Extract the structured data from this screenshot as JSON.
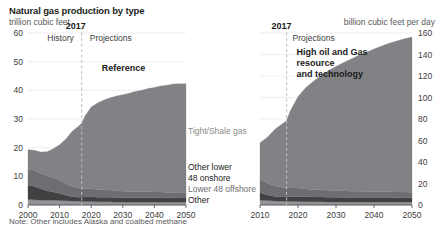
{
  "header": {
    "title": "Natural gas production by type",
    "subtitle_left": "trillion cubic feet",
    "subtitle_right": "billion cubic feet per day"
  },
  "footer": {
    "note": "Note: Other includes Alaska and coalbed methane"
  },
  "legend": {
    "tight_shale": "Tight/Shale gas",
    "other_lower_48_onshore_line1": "Other lower",
    "other_lower_48_onshore_line2": "48 onshore",
    "lower_48_offshore": "Lower 48 offshore",
    "other": "Other"
  },
  "colors": {
    "tight_shale": "#808285",
    "other_lower_48_onshore": "#6d6e71",
    "lower_48_offshore": "#414042",
    "other": "#939598",
    "axis": "#58595b",
    "gridline": "#e6e7e8",
    "divider": "#bcbec0"
  },
  "left_chart": {
    "divider_year_label": "2017",
    "history_label": "History",
    "projections_label": "Projections",
    "case_label": "Reference",
    "x_ticks": [
      "2000",
      "2010",
      "2020",
      "2030",
      "2040",
      "2050"
    ],
    "y_ticks": [
      "0",
      "10",
      "20",
      "30",
      "40",
      "50",
      "60"
    ]
  },
  "right_chart": {
    "divider_year_label": "2017",
    "projections_label": "Projections",
    "case_label_line1": "High oil and Gas",
    "case_label_line2": "resource",
    "case_label_line3": "and technology",
    "x_ticks": [
      "2010",
      "2020",
      "2030",
      "2040",
      "2050"
    ],
    "y_ticks": [
      "0",
      "20",
      "40",
      "60",
      "80",
      "100",
      "120",
      "140",
      "160"
    ]
  },
  "chart_data": [
    {
      "type": "area",
      "id": "reference-case",
      "title": "Natural gas production by type — Reference",
      "subtitle": "trillion cubic feet",
      "xlabel": "",
      "ylabel": "trillion cubic feet",
      "xlim": [
        2000,
        2050
      ],
      "ylim": [
        0,
        60
      ],
      "ytick_step": 10,
      "xtick_step": 10,
      "grid": true,
      "stacked": true,
      "legend_position": "right-inline",
      "history_projection_split": 2017,
      "x": [
        2000,
        2002,
        2004,
        2006,
        2008,
        2010,
        2012,
        2014,
        2016,
        2017,
        2018,
        2020,
        2022,
        2024,
        2026,
        2028,
        2030,
        2032,
        2034,
        2036,
        2038,
        2040,
        2042,
        2044,
        2046,
        2048,
        2050
      ],
      "series": [
        {
          "name": "Other",
          "color": "#939598",
          "values": [
            1.9,
            1.8,
            1.7,
            1.7,
            1.7,
            1.6,
            1.5,
            1.4,
            1.3,
            1.3,
            1.2,
            1.2,
            1.1,
            1.1,
            1.1,
            1.0,
            1.0,
            1.0,
            1.0,
            1.0,
            1.0,
            1.0,
            1.0,
            1.0,
            1.0,
            1.0,
            1.0
          ]
        },
        {
          "name": "Lower 48 offshore",
          "color": "#414042",
          "values": [
            5.0,
            4.7,
            4.0,
            3.3,
            2.8,
            2.5,
            1.9,
            1.5,
            1.4,
            1.5,
            1.6,
            1.7,
            1.6,
            1.6,
            1.6,
            1.6,
            1.5,
            1.5,
            1.5,
            1.5,
            1.5,
            1.5,
            1.5,
            1.5,
            1.5,
            1.4,
            1.4
          ]
        },
        {
          "name": "Other lower 48 onshore",
          "color": "#6d6e71",
          "values": [
            5.5,
            5.6,
            5.4,
            5.3,
            5.1,
            4.6,
            4.0,
            3.6,
            3.2,
            3.0,
            2.9,
            2.8,
            2.7,
            2.6,
            2.5,
            2.4,
            2.3,
            2.2,
            2.2,
            2.1,
            2.1,
            2.0,
            2.0,
            1.9,
            1.9,
            1.9,
            1.8
          ]
        },
        {
          "name": "Tight/Shale gas",
          "color": "#808285",
          "values": [
            6.9,
            7.0,
            7.4,
            8.3,
            10.0,
            12.3,
            15.6,
            19.2,
            21.6,
            22.7,
            25.3,
            28.5,
            30.2,
            31.3,
            32.2,
            33.0,
            33.7,
            34.3,
            34.9,
            35.4,
            36.0,
            36.5,
            37.0,
            37.4,
            37.8,
            38.0,
            38.1
          ]
        }
      ],
      "totals": [
        19.3,
        19.1,
        18.5,
        18.6,
        19.6,
        21.0,
        23.0,
        25.7,
        27.5,
        28.5,
        31.0,
        34.2,
        35.6,
        36.6,
        37.4,
        38.0,
        38.5,
        39.0,
        39.6,
        40.0,
        40.6,
        41.0,
        41.5,
        41.8,
        42.2,
        42.3,
        42.3
      ]
    },
    {
      "type": "area",
      "id": "high-oil-and-gas-resource-and-technology-case",
      "title": "Natural gas production by type — High oil and Gas resource and technology",
      "subtitle": "billion cubic feet per day",
      "xlabel": "",
      "ylabel": "billion cubic feet per day",
      "xlim": [
        2010,
        2050
      ],
      "ylim": [
        0,
        160
      ],
      "ytick_step": 20,
      "xtick_step": 10,
      "grid": true,
      "stacked": true,
      "legend_position": "shared-left",
      "history_projection_split": 2017,
      "x": [
        2010,
        2012,
        2014,
        2016,
        2017,
        2018,
        2020,
        2022,
        2024,
        2026,
        2028,
        2030,
        2032,
        2034,
        2036,
        2038,
        2040,
        2042,
        2044,
        2046,
        2048,
        2050
      ],
      "series": [
        {
          "name": "Other",
          "color": "#939598",
          "values": [
            4.4,
            4.1,
            3.8,
            3.6,
            3.6,
            3.4,
            3.3,
            3.1,
            3.0,
            3.0,
            2.9,
            2.9,
            2.8,
            2.8,
            2.8,
            2.8,
            2.8,
            2.8,
            2.8,
            2.8,
            2.8,
            2.8
          ]
        },
        {
          "name": "Lower 48 offshore",
          "color": "#414042",
          "values": [
            6.9,
            5.2,
            4.1,
            3.9,
            4.1,
            4.4,
            4.7,
            4.5,
            4.4,
            4.4,
            4.3,
            4.2,
            4.2,
            4.1,
            4.1,
            4.1,
            4.1,
            4.1,
            4.1,
            4.0,
            4.0,
            4.0
          ]
        },
        {
          "name": "Other lower 48 onshore",
          "color": "#6d6e71",
          "values": [
            12.6,
            11.0,
            9.9,
            8.8,
            8.3,
            8.0,
            7.7,
            7.4,
            7.1,
            6.9,
            6.6,
            6.4,
            6.2,
            6.0,
            5.9,
            5.7,
            5.6,
            5.5,
            5.4,
            5.3,
            5.2,
            5.1
          ]
        },
        {
          "name": "Tight/Shale gas",
          "color": "#808285",
          "values": [
            33.7,
            42.9,
            52.8,
            59.4,
            62.5,
            72.1,
            85.1,
            94.0,
            100.5,
            106.2,
            111.0,
            115.4,
            119.3,
            123.0,
            126.4,
            129.6,
            132.6,
            135.4,
            138.1,
            140.5,
            142.6,
            144.3
          ]
        }
      ],
      "totals": [
        57.6,
        63.2,
        70.6,
        75.7,
        78.5,
        87.9,
        100.8,
        109.0,
        115.0,
        120.5,
        124.8,
        128.9,
        132.5,
        135.9,
        139.2,
        142.2,
        145.1,
        147.8,
        150.4,
        152.6,
        154.6,
        156.2
      ]
    }
  ]
}
